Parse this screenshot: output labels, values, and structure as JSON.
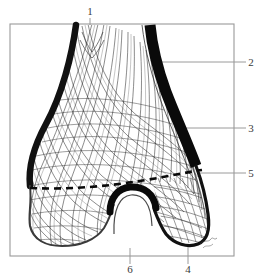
{
  "figure": {
    "view": "anterior",
    "style": "line-engraving-with-crosshatch-mesh",
    "background_color": "#ffffff",
    "ink_color": "#1b1b1b",
    "frame": {
      "name": "plate-border",
      "color": "#9a9a9a",
      "x": 10,
      "y": 24,
      "width": 224,
      "height": 232
    },
    "signature": {
      "name": "artist-signature",
      "text": "",
      "legible": false,
      "x": 205,
      "y": 243
    }
  },
  "labels": [
    {
      "id": "1",
      "text": "1",
      "x": 90,
      "y": 11,
      "leader": {
        "x1": 90,
        "y1": 18,
        "x2": 90,
        "y2": 48
      },
      "position": "top"
    },
    {
      "id": "2",
      "text": "2",
      "x": 251,
      "y": 66,
      "leader": {
        "x1": 246,
        "y1": 62,
        "x2": 160,
        "y2": 62
      },
      "position": "right"
    },
    {
      "id": "3",
      "text": "3",
      "x": 251,
      "y": 132,
      "leader": {
        "x1": 246,
        "y1": 128,
        "x2": 112,
        "y2": 128
      },
      "position": "right"
    },
    {
      "id": "5",
      "text": "5",
      "x": 251,
      "y": 177,
      "leader": {
        "x1": 246,
        "y1": 173,
        "x2": 196,
        "y2": 173
      },
      "position": "right"
    },
    {
      "id": "4",
      "text": "4",
      "x": 188,
      "y": 272,
      "leader": {
        "x1": 188,
        "y1": 264,
        "x2": 188,
        "y2": 232
      },
      "position": "bottom"
    },
    {
      "id": "6",
      "text": "6",
      "x": 130,
      "y": 272,
      "leader": {
        "x1": 130,
        "y1": 264,
        "x2": 130,
        "y2": 206
      },
      "position": "bottom"
    }
  ],
  "features": {
    "shaft": {
      "name": "femoral-shaft",
      "description": "tapering diaphysis entering from top"
    },
    "cortex_left": {
      "name": "cortical-bone-left-margin",
      "description": "thick dark cortical border on lateral side"
    },
    "cortex_right": {
      "name": "cortical-bone-right-margin",
      "description": "thick dark cortical border sweeping down right"
    },
    "condyle_left": {
      "name": "medial-condyle",
      "description": "rounded bulging condyle, left of image"
    },
    "condyle_right": {
      "name": "lateral-condyle",
      "description": "rounded condyle, right of image"
    },
    "notch": {
      "name": "intercondylar-notch",
      "description": "U-shaped central fossa between condyles"
    },
    "epiphyseal_line": {
      "name": "epiphyseal-line",
      "style": "dashed",
      "description": "dashed line marking growth plate across metaphysis"
    },
    "trabeculae": {
      "name": "trabecular-mesh",
      "description": "dense crossing curvilinear trabecular lattice filling cancellous bone"
    }
  }
}
